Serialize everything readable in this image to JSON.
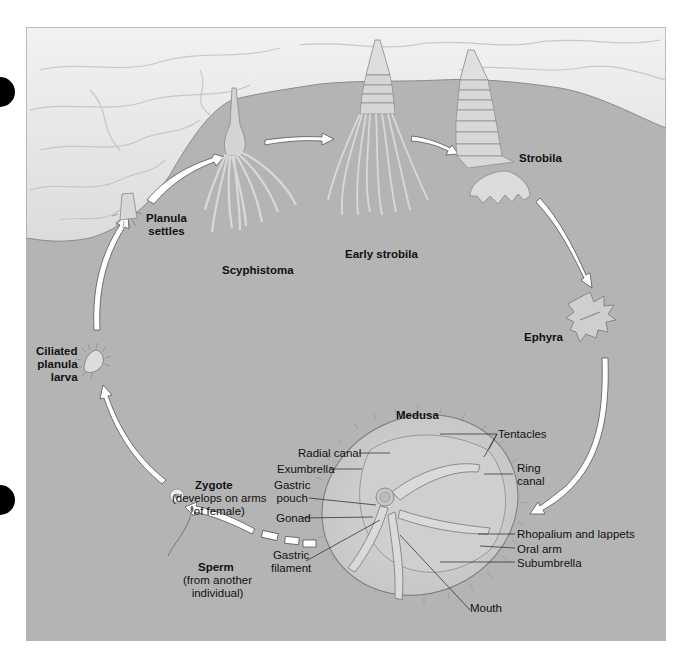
{
  "figure": {
    "type": "life-cycle diagram"
  },
  "stages": {
    "planula_settles": "Planula\nsettles",
    "scyphistoma": "Scyphistoma",
    "early_strobila": "Early strobila",
    "strobila": "Strobila",
    "ephyra": "Ephyra",
    "medusa": "Medusa",
    "zygote": "Zygote",
    "zygote_note": "(develops on arms\nof female)",
    "sperm": "Sperm",
    "sperm_note": "(from another\nindividual)",
    "ciliated_planula_larva": "Ciliated\nplanula\nlarva"
  },
  "medusa_parts": {
    "radial_canal": "Radial canal",
    "exumbrella": "Exumbrella",
    "gastric_pouch": "Gastric\npouch",
    "gonad": "Gonad",
    "gastric_filament": "Gastric\nfilament",
    "tentacles": "Tentacles",
    "ring_canal": "Ring\ncanal",
    "rhopalium_and_lappets": "Rhopalium and lappets",
    "oral_arm": "Oral arm",
    "subumbrella": "Subumbrella",
    "mouth": "Mouth"
  },
  "colors": {
    "background_panel": "#b4b4b4",
    "substrate_rock": "#e9e9e9",
    "arrow_fill": "#ffffff",
    "label_text": "#111111"
  }
}
